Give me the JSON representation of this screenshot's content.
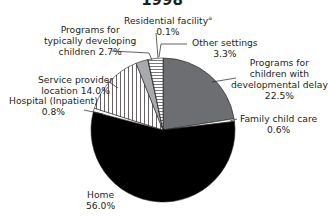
{
  "chart_data": {
    "type": "pie",
    "title": "1998",
    "start_angle_deg": 0,
    "direction": "clockwise",
    "slices": [
      {
        "label": "Programs for children with developmental delay",
        "value": 22.5,
        "fill": "#6d6e71",
        "pattern": "solid"
      },
      {
        "label": "Family child care",
        "value": 0.6,
        "fill": "#ffffff",
        "pattern": "solid"
      },
      {
        "label": "Home",
        "value": 56.0,
        "fill": "#000000",
        "pattern": "solid"
      },
      {
        "label": "Hospital (Inpatient)",
        "value": 0.8,
        "fill": "#ffffff",
        "pattern": "solid"
      },
      {
        "label": "Service provider location",
        "value": 14.0,
        "fill": "#ffffff",
        "pattern": "vertical-stripes"
      },
      {
        "label": "Programs for typically developing children",
        "value": 2.7,
        "fill": "#a7a9ac",
        "pattern": "solid"
      },
      {
        "label": "Residential facility",
        "value": 0.1,
        "fill": "#ffffff",
        "pattern": "solid",
        "footnote": "a"
      },
      {
        "label": "Other settings",
        "value": 3.3,
        "fill": "#ffffff",
        "pattern": "horizontal-stripes"
      }
    ],
    "legend": "none (direct labels with leader lines)"
  },
  "title": "1998",
  "labels": {
    "residential": {
      "l1": "Residential facility",
      "sup": "a",
      "l2": "0.1%"
    },
    "typical": {
      "l1": "Programs for",
      "l2": "typically developing",
      "l3": "children 2.7%"
    },
    "other": {
      "l1": "Other settings",
      "l2": "3.3%"
    },
    "devdelay": {
      "l1": "Programs for",
      "l2": "children with",
      "l3": "developmental delay",
      "l4": "22.5%"
    },
    "service": {
      "l1": "Service provider",
      "l2": "location 14.0%"
    },
    "hospital": {
      "l1": "Hospital (Inpatient)",
      "l2": "0.8%"
    },
    "family": {
      "l1": "Family child care",
      "l2": "0.6%"
    },
    "home": {
      "l1": "Home",
      "l2": "56.0%"
    }
  }
}
